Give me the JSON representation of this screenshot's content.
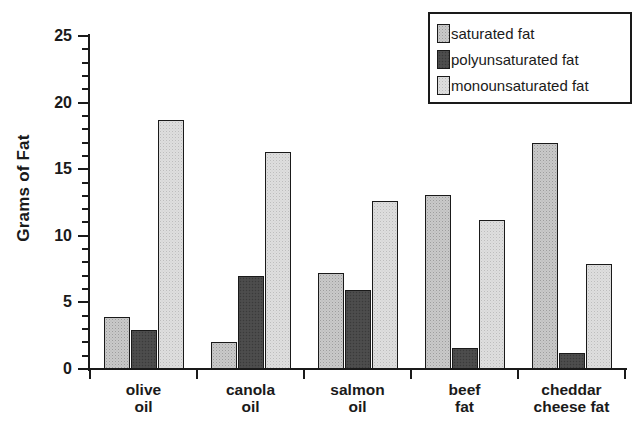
{
  "chart_data": {
    "type": "bar",
    "title": "",
    "xlabel": "",
    "ylabel": "Grams of Fat",
    "ylim": [
      0,
      25
    ],
    "y_ticks": [
      0,
      5,
      10,
      15,
      20,
      25
    ],
    "y_minor_step": 1,
    "grid": false,
    "legend_position": "top-right",
    "categories": [
      "olive oil",
      "canola oil",
      "salmon oil",
      "beef fat",
      "cheddar cheese fat"
    ],
    "category_lines": [
      {
        "line1": "olive",
        "line2": "oil"
      },
      {
        "line1": "canola",
        "line2": "oil"
      },
      {
        "line1": "salmon",
        "line2": "oil"
      },
      {
        "line1": "beef",
        "line2": "fat"
      },
      {
        "line1": "cheddar",
        "line2": "cheese fat"
      }
    ],
    "series": [
      {
        "name": "saturated fat",
        "color": "#c9c9c9",
        "values": [
          3.9,
          2.0,
          7.2,
          13.1,
          17.0
        ]
      },
      {
        "name": "polyunsaturated fat",
        "color": "#4a4a4a",
        "values": [
          2.9,
          7.0,
          5.9,
          1.6,
          1.2
        ]
      },
      {
        "name": "monounsaturated fat",
        "color": "#dedede",
        "values": [
          18.7,
          16.3,
          12.6,
          11.2,
          7.9
        ]
      }
    ]
  },
  "axis": {
    "y_title": "Grams of Fat",
    "tick_labels": [
      "25",
      "20",
      "15",
      "10",
      "5",
      "0"
    ]
  },
  "legend": {
    "entries": [
      {
        "label": "saturated fat",
        "swatch": "saturated-swatch"
      },
      {
        "label": "polyunsaturated fat",
        "swatch": "polyunsaturated-swatch"
      },
      {
        "label": "monounsaturated fat",
        "swatch": "monounsaturated-swatch"
      }
    ]
  }
}
